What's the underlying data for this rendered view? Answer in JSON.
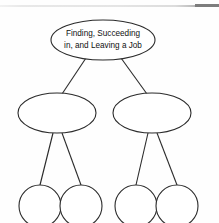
{
  "page": {
    "background_color": "#fefefe",
    "stroke_color": "#2b2b2b",
    "header_rule_color": "#e4e4e4",
    "header_rule_dark_color": "#7d7d7d"
  },
  "diagram": {
    "type": "hierarchy-tree",
    "levels": 3,
    "root": {
      "id": "root",
      "shape": "ellipse",
      "cx": 103,
      "cy": 40,
      "rx": 52,
      "ry": 20,
      "label_line_1": "Finding, Succeeding",
      "label_line_2": "in, and Leaving a Job"
    },
    "branches": [
      {
        "id": "branch-left",
        "shape": "ellipse",
        "cx": 57,
        "cy": 113,
        "rx": 39,
        "ry": 20,
        "label": ""
      },
      {
        "id": "branch-right",
        "shape": "ellipse",
        "cx": 152,
        "cy": 113,
        "rx": 39,
        "ry": 20,
        "label": ""
      }
    ],
    "leaves": [
      {
        "id": "leaf-1",
        "shape": "circle",
        "cx": 40,
        "cy": 206,
        "r": 21,
        "label": "",
        "parent": "branch-left"
      },
      {
        "id": "leaf-2",
        "shape": "circle",
        "cx": 81,
        "cy": 206,
        "r": 21,
        "label": "",
        "parent": "branch-left"
      },
      {
        "id": "leaf-3",
        "shape": "circle",
        "cx": 136,
        "cy": 206,
        "r": 21,
        "label": "",
        "parent": "branch-right"
      },
      {
        "id": "leaf-4",
        "shape": "circle",
        "cx": 177,
        "cy": 206,
        "r": 21,
        "label": "",
        "parent": "branch-right"
      }
    ],
    "connectors": [
      {
        "id": "root-to-branch-left",
        "x1": 86,
        "y1": 58,
        "x2": 62,
        "y2": 94
      },
      {
        "id": "root-to-branch-right",
        "x1": 121,
        "y1": 58,
        "x2": 147,
        "y2": 94
      },
      {
        "id": "branch-left-to-leaf-1",
        "x1": 53,
        "y1": 133,
        "x2": 40,
        "y2": 185
      },
      {
        "id": "branch-left-to-leaf-2",
        "x1": 62,
        "y1": 133,
        "x2": 81,
        "y2": 185
      },
      {
        "id": "branch-right-to-leaf-3",
        "x1": 148,
        "y1": 133,
        "x2": 136,
        "y2": 185
      },
      {
        "id": "branch-right-to-leaf-4",
        "x1": 157,
        "y1": 133,
        "x2": 177,
        "y2": 185
      }
    ]
  }
}
